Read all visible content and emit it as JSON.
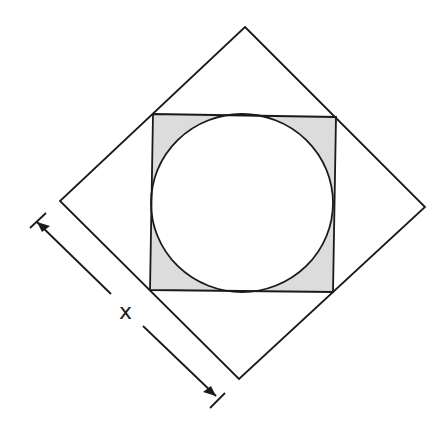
{
  "diagram": {
    "dimension_label": "x",
    "colors": {
      "stroke": "#1a1a1a",
      "shade": "#dcdcdc",
      "background": "#ffffff"
    }
  }
}
